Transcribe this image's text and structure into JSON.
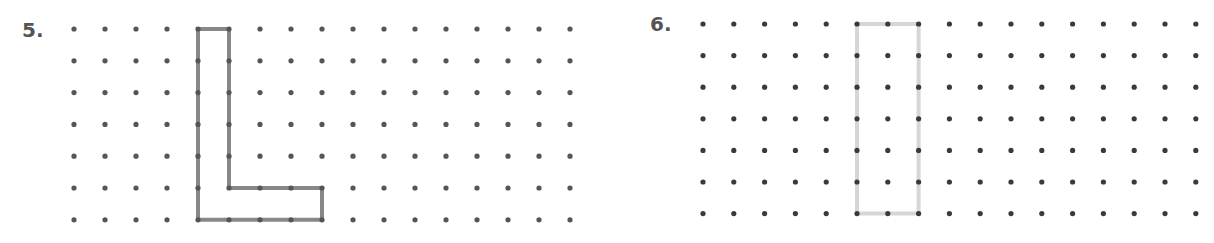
{
  "problems": [
    {
      "number_label": "5.",
      "label_pos": [
        22,
        18
      ],
      "grid": {
        "origin": [
          74,
          29
        ],
        "dx": 31,
        "dy": 31.8,
        "cols": 17,
        "rows": 7,
        "dot_color": "#555555"
      },
      "shape": {
        "name": "L-shape",
        "stroke": "#888888",
        "stroke_width": 4,
        "points": [
          [
            4,
            0
          ],
          [
            5,
            0
          ],
          [
            5,
            5
          ],
          [
            8,
            5
          ],
          [
            8,
            6
          ],
          [
            4,
            6
          ]
        ]
      }
    },
    {
      "number_label": "6.",
      "label_pos": [
        650,
        12
      ],
      "grid": {
        "origin": [
          703,
          24
        ],
        "dx": 30.8,
        "dy": 31.6,
        "cols": 17,
        "rows": 7,
        "dot_color": "#3a3a3a"
      },
      "shape": {
        "name": "rectangle",
        "stroke": "#d6d6d6",
        "stroke_width": 4,
        "points": [
          [
            5,
            0
          ],
          [
            7,
            0
          ],
          [
            7,
            6
          ],
          [
            5,
            6
          ]
        ]
      }
    }
  ]
}
